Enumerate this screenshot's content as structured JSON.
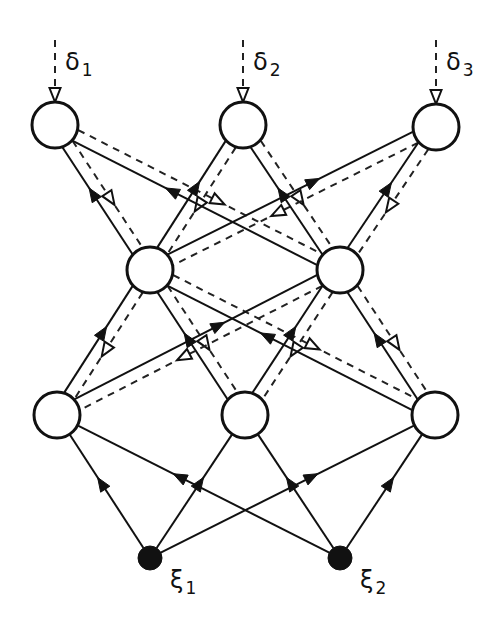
{
  "colors": {
    "stroke": "#111111",
    "background": "#ffffff",
    "node_fill": "#ffffff",
    "input_fill": "#111111"
  },
  "layers": {
    "input": {
      "nodes": [
        {
          "id": "xi1",
          "symbol": "ξ",
          "subscript": "1"
        },
        {
          "id": "xi2",
          "symbol": "ξ",
          "subscript": "2"
        }
      ]
    },
    "hidden1": {
      "nodes": [
        {
          "id": "b1"
        },
        {
          "id": "b2"
        },
        {
          "id": "b3"
        }
      ]
    },
    "hidden2": {
      "nodes": [
        {
          "id": "m1"
        },
        {
          "id": "m2"
        }
      ]
    },
    "output": {
      "nodes": [
        {
          "id": "t1",
          "error_symbol": "δ",
          "error_subscript": "1"
        },
        {
          "id": "t2",
          "error_symbol": "δ",
          "error_subscript": "2"
        },
        {
          "id": "t3",
          "error_symbol": "δ",
          "error_subscript": "3"
        }
      ]
    }
  },
  "edges": {
    "forward": [
      [
        "xi1",
        "b1"
      ],
      [
        "xi1",
        "b2"
      ],
      [
        "xi1",
        "b3"
      ],
      [
        "xi2",
        "b1"
      ],
      [
        "xi2",
        "b2"
      ],
      [
        "xi2",
        "b3"
      ],
      [
        "b1",
        "m1"
      ],
      [
        "b1",
        "m2"
      ],
      [
        "b2",
        "m1"
      ],
      [
        "b2",
        "m2"
      ],
      [
        "b3",
        "m1"
      ],
      [
        "b3",
        "m2"
      ],
      [
        "m1",
        "t1"
      ],
      [
        "m1",
        "t2"
      ],
      [
        "m1",
        "t3"
      ],
      [
        "m2",
        "t1"
      ],
      [
        "m2",
        "t2"
      ],
      [
        "m2",
        "t3"
      ]
    ],
    "backward": [
      [
        "t1",
        "m1"
      ],
      [
        "t1",
        "m2"
      ],
      [
        "t2",
        "m1"
      ],
      [
        "t2",
        "m2"
      ],
      [
        "t3",
        "m1"
      ],
      [
        "t3",
        "m2"
      ],
      [
        "m1",
        "b1"
      ],
      [
        "m1",
        "b2"
      ],
      [
        "m1",
        "b3"
      ],
      [
        "m2",
        "b1"
      ],
      [
        "m2",
        "b2"
      ],
      [
        "m2",
        "b3"
      ]
    ]
  },
  "legend": {
    "forward_style": "solid line, filled arrowhead",
    "backward_style": "dashed line, open arrowhead"
  }
}
